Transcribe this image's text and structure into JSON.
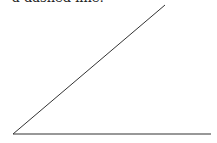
{
  "caption": {
    "text": "a dashed line:"
  },
  "diagram": {
    "type": "angle",
    "stroke_color": "#333333",
    "stroke_width": 1,
    "vertex": {
      "x": 13,
      "y": 134
    },
    "rays": [
      {
        "name": "diagonal-ray",
        "x2": 165,
        "y2": 5
      },
      {
        "name": "horizontal-ray",
        "x2": 211,
        "y2": 134
      }
    ]
  }
}
